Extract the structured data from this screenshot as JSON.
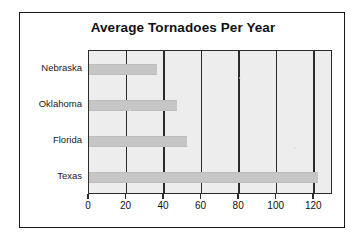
{
  "chart_data": {
    "type": "bar",
    "orientation": "horizontal",
    "title": "Average Tornadoes Per Year",
    "xlabel": "",
    "ylabel": "",
    "categories": [
      "Nebraska",
      "Oklahoma",
      "Florida",
      "Texas"
    ],
    "values": [
      36,
      47,
      52,
      122
    ],
    "series": [
      {
        "name": "Average Tornadoes Per Year",
        "values": [
          36,
          47,
          52,
          122
        ]
      }
    ],
    "xlim": [
      0,
      130
    ],
    "xticks": [
      0,
      20,
      40,
      60,
      80,
      100,
      120
    ],
    "xtick_labels": [
      "0",
      "20",
      "40",
      "60",
      "80",
      "100",
      "120"
    ],
    "grid": "vertical",
    "legend": "none",
    "bar_color": "#c6c6c6",
    "plot_background": "#ededed",
    "gridline_color": "#2b2b2b",
    "border_color": "#1a1a1a",
    "text_color": "#111111"
  }
}
